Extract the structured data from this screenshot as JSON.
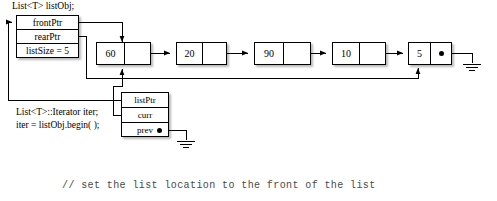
{
  "diagram": {
    "title_label": "List<T> listObj;",
    "list_object": {
      "name": "listobj-struct",
      "fields": [
        {
          "label": "frontPtr"
        },
        {
          "label": "rearPtr"
        },
        {
          "label": "listSize = 5"
        }
      ]
    },
    "nodes": [
      {
        "value": "60",
        "link": ""
      },
      {
        "value": "20",
        "link": ""
      },
      {
        "value": "90",
        "link": ""
      },
      {
        "value": "10",
        "link": ""
      },
      {
        "value": "5",
        "link": "null-dot"
      }
    ],
    "iterator": {
      "decl_line1": "List<T>::Iterator iter;",
      "decl_line2": "iter = listObj.begin( );",
      "fields": [
        {
          "label": "listPtr"
        },
        {
          "label": "curr"
        },
        {
          "label": "prev"
        }
      ]
    },
    "icons": {
      "ground": "ground-symbol",
      "null_dot": "null-pointer-dot",
      "arrow": "arrowhead"
    },
    "colors": {
      "line": "#000000",
      "box_fill": "#ffffff",
      "comment_text": "#4a4a4a"
    },
    "comment": "// set the list location to the front of the list"
  }
}
